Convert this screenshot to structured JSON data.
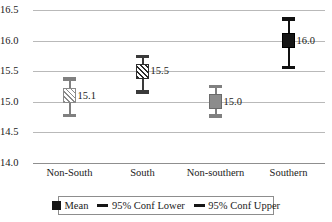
{
  "chart_data": {
    "type": "scatter",
    "title": "",
    "subtitle": "",
    "xlabel": "",
    "ylabel": "",
    "ylim": [
      14.0,
      16.5
    ],
    "ytick_labels": [
      "16.5",
      "16.0",
      "15.5",
      "15.0",
      "14.5",
      "14.0"
    ],
    "ytick_values": [
      16.5,
      16.0,
      15.5,
      15.0,
      14.5,
      14.0
    ],
    "grid": true,
    "legend_position": "bottom",
    "categories": [
      "Non-South",
      "South",
      "Non-southern",
      "Southern"
    ],
    "values": [
      15.1,
      15.5,
      15.0,
      16.0
    ],
    "data_labels": [
      "15.1",
      "15.5",
      "15.0",
      "16.0"
    ],
    "series": [
      {
        "name": "Mean",
        "values": [
          15.1,
          15.5,
          15.0,
          16.0
        ]
      },
      {
        "name": "95% Conf Lower",
        "values": [
          14.78,
          15.16,
          14.77,
          15.56
        ]
      },
      {
        "name": "95% Conf Upper",
        "values": [
          15.37,
          15.74,
          15.25,
          16.35
        ]
      }
    ],
    "points": [
      {
        "category": "Non-South",
        "mean": 15.1,
        "label": "15.1",
        "conf_lower": 14.78,
        "conf_upper": 15.37,
        "marker_style": "hatch-light"
      },
      {
        "category": "South",
        "mean": 15.5,
        "label": "15.5",
        "conf_lower": 15.16,
        "conf_upper": 15.74,
        "marker_style": "hatch-dark"
      },
      {
        "category": "Non-southern",
        "mean": 15.0,
        "label": "15.0",
        "conf_lower": 14.77,
        "conf_upper": 15.25,
        "marker_style": "solid-gray"
      },
      {
        "category": "Southern",
        "mean": 16.0,
        "label": "16.0",
        "conf_lower": 15.56,
        "conf_upper": 16.35,
        "marker_style": "solid-black"
      }
    ]
  },
  "legend": {
    "items": [
      {
        "label": "Mean",
        "symbol": "square",
        "color": "#161616"
      },
      {
        "label": "95% Conf Lower",
        "symbol": "dash",
        "color": "#161616"
      },
      {
        "label": "95% Conf Upper",
        "symbol": "dash",
        "color": "#161616"
      }
    ]
  },
  "colors": {
    "gridline": "#b9b9b9",
    "axis": "#8f8f8f",
    "text": "#1a1a1a",
    "marker_light": "#8a8a8a",
    "marker_dark": "#2b2b2b",
    "marker_gray": "#8c8c8c",
    "marker_black": "#161616"
  }
}
